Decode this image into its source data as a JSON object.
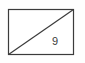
{
  "figure": {
    "kind": "geometry-diagram",
    "background_color": "#fefefe",
    "stroke_color": "#3b3b3b",
    "fill_color": "#ffffff",
    "rectangle": {
      "x": 8.5,
      "y": 9.5,
      "width": 65,
      "height": 45,
      "stroke_width": 1.2
    },
    "diagonal": {
      "name": "diagonal-line",
      "from": {
        "x": 8.5,
        "y": 54.5
      },
      "to": {
        "x": 73.5,
        "y": 9.5
      },
      "stroke_width": 1.2
    },
    "labels": [
      {
        "name": "diagonal-length-label",
        "text": "9",
        "x": 55,
        "y": 42,
        "color": "#3b3b3b",
        "font_size": 11
      }
    ]
  }
}
